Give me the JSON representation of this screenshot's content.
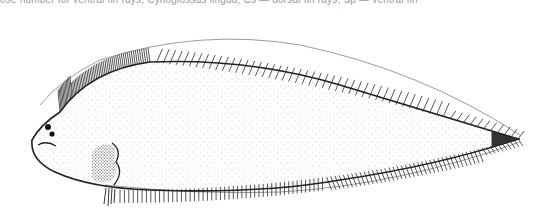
{
  "figure": {
    "caption_fragment": "ose number for ventral fin rays, Cynoglossus lingua; Cs — dorsal fin rays; Sp — ventral fin",
    "colors": {
      "line": "#222222",
      "stipple": "#8a8a8a",
      "background": "#ffffff"
    }
  }
}
